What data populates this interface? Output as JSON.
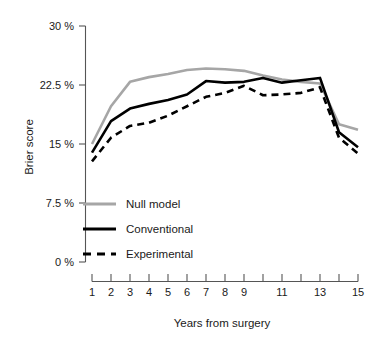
{
  "chart_data": {
    "type": "line",
    "title": "",
    "xlabel": "Years from surgery",
    "ylabel": "Brier score",
    "x": [
      1,
      2,
      3,
      4,
      5,
      6,
      7,
      8,
      9,
      10,
      11,
      12,
      13,
      14,
      15
    ],
    "xlim": [
      1,
      15
    ],
    "ylim": [
      0,
      30
    ],
    "xticks": [
      1,
      2,
      3,
      4,
      5,
      6,
      7,
      8,
      9,
      10,
      11,
      12,
      13,
      14,
      15
    ],
    "xtick_labels": [
      "1",
      "2",
      "3",
      "4",
      "5",
      "6",
      "7",
      "8",
      "9",
      "",
      "11",
      "",
      "13",
      "",
      "15"
    ],
    "yticks": [
      0,
      7.5,
      15,
      22.5,
      30
    ],
    "ytick_labels": [
      "0 %",
      "7.5 %",
      "15 %",
      "22.5 %",
      "30 %"
    ],
    "grid": false,
    "legend_position": "bottom-left",
    "series": [
      {
        "name": "Null model",
        "color": "#a6a6a6",
        "style": "solid",
        "width": 2.6,
        "values": [
          15.0,
          19.8,
          22.9,
          23.5,
          23.9,
          24.4,
          24.6,
          24.5,
          24.3,
          23.7,
          23.2,
          22.9,
          22.7,
          17.5,
          16.8
        ]
      },
      {
        "name": "Conventional",
        "color": "#000000",
        "style": "solid",
        "width": 2.6,
        "values": [
          13.9,
          17.9,
          19.5,
          20.1,
          20.6,
          21.3,
          23.0,
          22.8,
          22.9,
          23.4,
          22.8,
          23.1,
          23.4,
          16.5,
          14.6
        ]
      },
      {
        "name": "Experimental",
        "color": "#000000",
        "style": "dashed",
        "width": 2.6,
        "values": [
          12.8,
          15.8,
          17.3,
          17.7,
          18.6,
          19.8,
          21.0,
          21.5,
          22.4,
          21.2,
          21.3,
          21.5,
          22.2,
          15.8,
          13.8
        ]
      }
    ]
  },
  "axes": {
    "y_title": "Brier score",
    "x_title": "Years from surgery",
    "y_labels": [
      "30 %",
      "22.5 %",
      "15 %",
      "7.5 %",
      "0 %"
    ],
    "x_labels": [
      "1",
      "2",
      "3",
      "4",
      "5",
      "6",
      "7",
      "8",
      "9",
      "11",
      "13",
      "15"
    ]
  },
  "legend": {
    "items": [
      {
        "label": "Null model",
        "color": "#a6a6a6",
        "style": "solid"
      },
      {
        "label": "Conventional",
        "color": "#000000",
        "style": "solid"
      },
      {
        "label": "Experimental",
        "color": "#000000",
        "style": "dashed"
      }
    ]
  },
  "colors": {
    "null_model": "#a6a6a6",
    "conventional": "#000000",
    "experimental": "#000000",
    "axis": "#555555",
    "text": "#1a1a1a",
    "background": "#ffffff"
  }
}
